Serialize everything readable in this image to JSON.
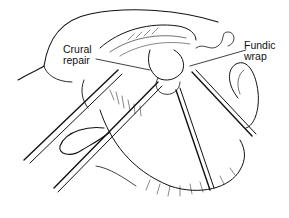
{
  "figure": {
    "type": "surgical line illustration",
    "background": "#ffffff",
    "ink_color": "#111111"
  },
  "labels": [
    {
      "id": "crural-repair",
      "lines": [
        "Crural",
        "repair"
      ]
    },
    {
      "id": "fundic-wrap",
      "lines": [
        "Fundic",
        "wrap"
      ]
    }
  ]
}
